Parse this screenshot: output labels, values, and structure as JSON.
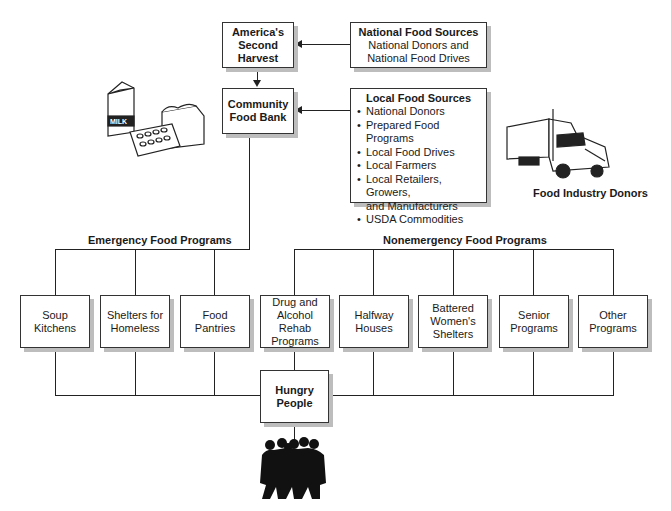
{
  "diagram": {
    "america_box": {
      "line1": "America's",
      "line2": "Second Harvest"
    },
    "community_box": {
      "line1": "Community",
      "line2": "Food Bank"
    },
    "national_sources": {
      "title": "National Food Sources",
      "line1": "National Donors and",
      "line2": "National Food Drives"
    },
    "local_sources": {
      "title": "Local Food Sources",
      "items": [
        "National Donors",
        "Prepared Food Programs",
        "Local Food Drives",
        "Local Farmers",
        "Local Retailers, Growers,",
        "USDA Commodities"
      ],
      "item4_cont": "and Manufacturers"
    },
    "food_industry_label": "Food Industry Donors",
    "milk_label": "MILK",
    "emergency_label": "Emergency Food Programs",
    "nonemergency_label": "Nonemergency Food Programs",
    "programs": [
      {
        "lines": [
          "Soup",
          "Kitchens"
        ]
      },
      {
        "lines": [
          "Shelters for",
          "Homeless"
        ]
      },
      {
        "lines": [
          "Food",
          "Pantries"
        ]
      },
      {
        "lines": [
          "Drug and",
          "Alcohol Rehab",
          "Programs"
        ]
      },
      {
        "lines": [
          "Halfway",
          "Houses"
        ]
      },
      {
        "lines": [
          "Battered",
          "Women's",
          "Shelters"
        ]
      },
      {
        "lines": [
          "Senior",
          "Programs"
        ]
      },
      {
        "lines": [
          "Other",
          "Programs"
        ]
      }
    ],
    "hungry_box": {
      "line1": "Hungry",
      "line2": "People"
    }
  }
}
